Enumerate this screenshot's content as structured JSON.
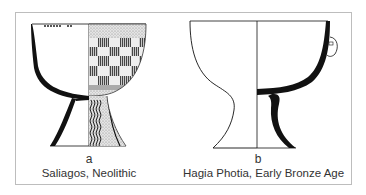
{
  "figures": [
    {
      "letter": "a",
      "caption": "Saliagos, Neolithic"
    },
    {
      "letter": "b",
      "caption": "Hagia Photia, Early Bronze Age"
    }
  ],
  "colors": {
    "ink": "#111111",
    "frame": "#bdbdbd",
    "text": "#333333",
    "background": "#ffffff"
  }
}
